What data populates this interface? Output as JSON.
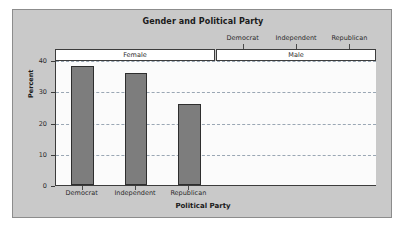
{
  "chart_data": {
    "type": "bar",
    "title": "Gender and Political Party",
    "xlabel": "Political Party",
    "ylabel": "Percent",
    "categories": [
      "Democrat",
      "Independent",
      "Republican"
    ],
    "panels": [
      {
        "label": "Female",
        "values": [
          38,
          36,
          26
        ]
      },
      {
        "label": "Male",
        "values": [
          38,
          36,
          26
        ]
      }
    ],
    "ylim": [
      0,
      40
    ],
    "yticks": [
      0,
      10,
      20,
      30,
      40
    ],
    "ytick_labels": [
      "0",
      "10",
      "20",
      "30",
      "40"
    ],
    "grid": true,
    "grid_style": "dashed",
    "legend": "none",
    "top_axis_labels": [
      "Democrat",
      "Independent",
      "Republican"
    ],
    "bottom_axis_labels": [
      "Democrat",
      "Independent",
      "Republican"
    ],
    "bar_color": "#7d7d7d",
    "bar_border_color": "#2e2e2e",
    "plot_background": "#fbfbfb",
    "figure_background": "#c9c9c9",
    "gridline_color": "#9aa7b4"
  }
}
